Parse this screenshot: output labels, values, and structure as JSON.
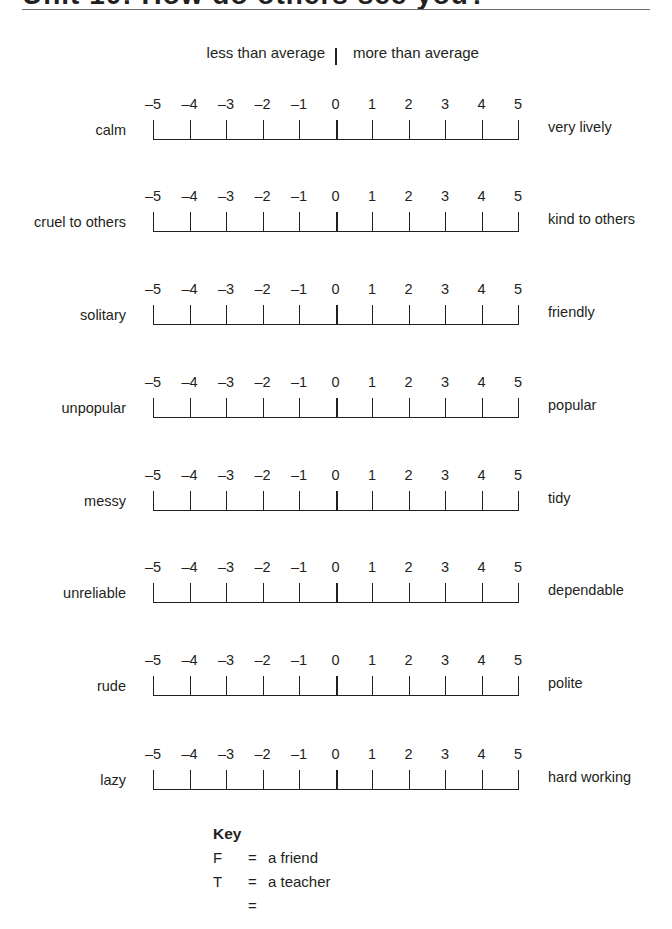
{
  "header": {
    "title": "Unit 10: How do others see you?"
  },
  "legend": {
    "less": "less than average",
    "more": "more than average"
  },
  "scale_ticks": [
    "–5",
    "–4",
    "–3",
    "–2",
    "–1",
    "0",
    "1",
    "2",
    "3",
    "4",
    "5"
  ],
  "scales": [
    {
      "left": "calm",
      "right": "very lively"
    },
    {
      "left": "cruel to others",
      "right": "kind to others"
    },
    {
      "left": "solitary",
      "right": "friendly"
    },
    {
      "left": "unpopular",
      "right": "popular"
    },
    {
      "left": "messy",
      "right": "tidy"
    },
    {
      "left": "unreliable",
      "right": "dependable"
    },
    {
      "left": "rude",
      "right": "polite"
    },
    {
      "left": "lazy",
      "right": "hard working"
    }
  ],
  "key": {
    "title": "Key",
    "entries": [
      {
        "symbol": "F",
        "eq": "=",
        "meaning": "a friend"
      },
      {
        "symbol": "T",
        "eq": "=",
        "meaning": "a teacher"
      },
      {
        "symbol": "",
        "eq": "=",
        "meaning": ""
      }
    ]
  }
}
